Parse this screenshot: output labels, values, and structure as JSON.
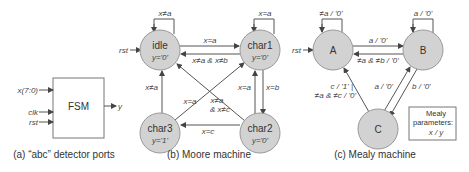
{
  "panel_a": {
    "caption": "(a) “abc” detector ports",
    "block_label": "FSM",
    "inputs": [
      "x(7:0)",
      "clk",
      "rst"
    ],
    "output": "y"
  },
  "panel_b": {
    "caption": "(b) Moore machine",
    "reset_label": "rst",
    "states": [
      {
        "name": "idle",
        "output": "y='0'"
      },
      {
        "name": "char1",
        "output": "y='0'"
      },
      {
        "name": "char2",
        "output": "y='0'"
      },
      {
        "name": "char3",
        "output": "y='1'"
      }
    ],
    "transitions": {
      "idle_self": "x≠a",
      "char1_self": "x=a",
      "idle_to_char1": "x=a",
      "char1_to_idle": "x≠a & x≠b",
      "char2_to_char1": "x=a",
      "char1_to_char2": "x=b",
      "char3_to_idle": "x≠a",
      "char3_to_char1": "x=a",
      "char2_to_idle_1": "x≠a",
      "char2_to_idle_2": "& x≠c",
      "char2_to_char3": "x=c"
    }
  },
  "panel_c": {
    "caption": "(c) Mealy machine",
    "reset_label": "rst",
    "states": [
      {
        "name": "A"
      },
      {
        "name": "B"
      },
      {
        "name": "C"
      }
    ],
    "transitions": {
      "A_self": "≠a / '0'",
      "B_self": "a / '0'",
      "A_to_B": "a / '0'",
      "B_to_A": "≠a & ≠b / '0'",
      "C_to_A_1": "c / '1' |",
      "C_to_A_2": "≠a & ≠c / '0'",
      "C_to_B": "a / '0'",
      "B_to_C": "b / '0'"
    },
    "legend": {
      "line1": "Mealy",
      "line2": "parameters:",
      "line3": "x / y"
    }
  }
}
